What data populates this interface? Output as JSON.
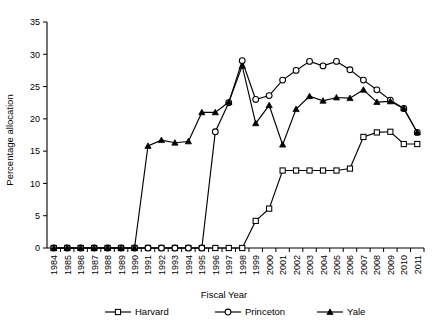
{
  "chart_data": {
    "type": "line",
    "title": "",
    "xlabel": "Fiscal Year",
    "ylabel": "Percentage allocation",
    "ylim": [
      0,
      35
    ],
    "ytick_step": 5,
    "yticks": [
      0,
      5,
      10,
      15,
      20,
      25,
      30,
      35
    ],
    "grid": false,
    "legend_position": "bottom",
    "categories": [
      "1984",
      "1985",
      "1986",
      "1987",
      "1988",
      "1989",
      "1990",
      "1991",
      "1992",
      "1993",
      "1994",
      "1995",
      "1996",
      "1997",
      "1998",
      "1999",
      "2000",
      "2001",
      "2002",
      "2003",
      "2004",
      "2005",
      "2006",
      "2007",
      "2008",
      "2009",
      "2010",
      "2011"
    ],
    "series": [
      {
        "name": "Harvard",
        "marker": "open-square",
        "values": [
          0,
          0,
          0,
          0,
          0,
          0,
          0,
          0,
          0,
          0,
          0,
          0,
          0,
          0,
          0,
          4.2,
          6.1,
          12.0,
          12.0,
          12.0,
          12.0,
          12.0,
          12.3,
          17.2,
          17.9,
          18.0,
          16.1,
          16.1
        ]
      },
      {
        "name": "Princeton",
        "marker": "open-circle",
        "values": [
          0,
          0,
          0,
          0,
          0,
          0,
          0,
          0,
          0,
          0,
          0,
          0,
          18.0,
          22.5,
          29.0,
          23.0,
          23.6,
          26.0,
          27.5,
          28.9,
          28.2,
          28.9,
          27.6,
          26.0,
          24.5,
          22.9,
          21.6,
          17.9
        ]
      },
      {
        "name": "Yale",
        "marker": "filled-triangle",
        "values": [
          0,
          0,
          0,
          0,
          0,
          0,
          0,
          15.8,
          16.7,
          16.3,
          16.5,
          21.0,
          21.0,
          22.6,
          28.2,
          19.3,
          22.1,
          16.0,
          21.5,
          23.5,
          22.8,
          23.3,
          23.2,
          24.5,
          22.6,
          22.7,
          21.6,
          17.9
        ]
      }
    ]
  },
  "legend": {
    "items": [
      {
        "label": "Harvard",
        "marker": "open-square"
      },
      {
        "label": "Princeton",
        "marker": "open-circle"
      },
      {
        "label": "Yale",
        "marker": "filled-triangle"
      }
    ]
  },
  "colors": {
    "axis": "#000000",
    "series": "#000000",
    "background": "#ffffff"
  }
}
